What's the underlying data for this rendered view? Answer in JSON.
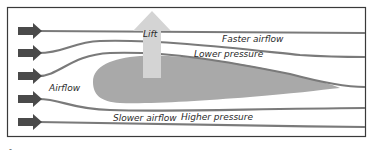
{
  "diagram": {
    "labels": {
      "lift": "Lift",
      "faster_airflow": "Faster airflow",
      "lower_pressure": "Lower pressure",
      "airflow": "Airflow",
      "slower_airflow": "Slower airflow",
      "higher_pressure": "Higher pressure"
    },
    "incoming_arrows": 5,
    "colors": {
      "frame": "#3a3a3a",
      "streamline": "#7a7a7a",
      "incoming_arrow": "#4a4a4a",
      "airfoil": "#a9a9a9",
      "lift_arrow": "#d4d4d4",
      "text": "#2b2b2b"
    },
    "footer_mark": "-"
  }
}
